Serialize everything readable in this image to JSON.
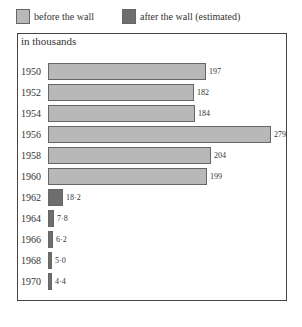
{
  "colors": {
    "before": "#b8b8b8",
    "after": "#6e6e6e",
    "border": "#555555"
  },
  "legend": {
    "before_label": "before the wall",
    "after_label": "after the wall (estimated)"
  },
  "unit_label": "in thousands",
  "rows": [
    {
      "year": "1950",
      "value": "197",
      "period": "before"
    },
    {
      "year": "1952",
      "value": "182",
      "period": "before"
    },
    {
      "year": "1954",
      "value": "184",
      "period": "before"
    },
    {
      "year": "1956",
      "value": "279",
      "period": "before"
    },
    {
      "year": "1958",
      "value": "204",
      "period": "before"
    },
    {
      "year": "1960",
      "value": "199",
      "period": "before"
    },
    {
      "year": "1962",
      "value": "18·2",
      "period": "after"
    },
    {
      "year": "1964",
      "value": "7·8",
      "period": "after"
    },
    {
      "year": "1966",
      "value": "6·2",
      "period": "after"
    },
    {
      "year": "1968",
      "value": "5·0",
      "period": "after"
    },
    {
      "year": "1970",
      "value": "4·4",
      "period": "after"
    }
  ],
  "chart_data": {
    "type": "bar",
    "orientation": "horizontal",
    "title": "",
    "xlabel": "",
    "ylabel": "",
    "unit": "in thousands",
    "categories": [
      "1950",
      "1952",
      "1954",
      "1956",
      "1958",
      "1960",
      "1962",
      "1964",
      "1966",
      "1968",
      "1970"
    ],
    "values": [
      197,
      182,
      184,
      279,
      204,
      199,
      18.2,
      7.8,
      6.2,
      5.0,
      4.4
    ],
    "series_assignment": [
      "before the wall",
      "before the wall",
      "before the wall",
      "before the wall",
      "before the wall",
      "before the wall",
      "after the wall (estimated)",
      "after the wall (estimated)",
      "after the wall (estimated)",
      "after the wall (estimated)",
      "after the wall (estimated)"
    ],
    "legend": [
      "before the wall",
      "after the wall (estimated)"
    ],
    "legend_position": "top",
    "grid": false,
    "xlim": [
      0,
      280
    ],
    "data_labels": [
      "197",
      "182",
      "184",
      "279",
      "204",
      "199",
      "18·2",
      "7·8",
      "6·2",
      "5·0",
      "4·4"
    ]
  }
}
